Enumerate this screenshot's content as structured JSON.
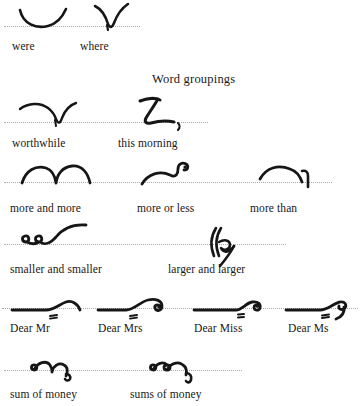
{
  "document": {
    "title": "Word groupings",
    "ink_color": "#161616",
    "rule_color": "#a9a9a9",
    "background": "#ffffff",
    "script": "shorthand"
  },
  "heading": {
    "label": "Word groupings"
  },
  "rows": [
    {
      "id": "row-1",
      "baseline_y": 26,
      "caption_y": 40,
      "items": [
        {
          "id": "were",
          "caption": "were",
          "outline_name": "shorthand-outline-were"
        },
        {
          "id": "where",
          "caption": "where",
          "outline_name": "shorthand-outline-where"
        }
      ]
    },
    {
      "id": "row-2",
      "baseline_y": 122,
      "caption_y": 137,
      "items": [
        {
          "id": "worthwhile",
          "caption": "worthwhile",
          "outline_name": "shorthand-outline-worthwhile"
        },
        {
          "id": "this-morning",
          "caption": "this morning",
          "outline_name": "shorthand-outline-this-morning"
        }
      ]
    },
    {
      "id": "row-3",
      "baseline_y": 182,
      "caption_y": 202,
      "items": [
        {
          "id": "more-and-more",
          "caption": "more and more",
          "outline_name": "shorthand-outline-more-and-more"
        },
        {
          "id": "more-or-less",
          "caption": "more or less",
          "outline_name": "shorthand-outline-more-or-less"
        },
        {
          "id": "more-than",
          "caption": "more than",
          "outline_name": "shorthand-outline-more-than"
        }
      ]
    },
    {
      "id": "row-4",
      "baseline_y": 244,
      "caption_y": 263,
      "items": [
        {
          "id": "smaller-and-smaller",
          "caption": "smaller and smaller",
          "outline_name": "shorthand-outline-smaller-and-smaller"
        },
        {
          "id": "larger-and-larger",
          "caption": "larger and larger",
          "outline_name": "shorthand-outline-larger-and-larger"
        }
      ]
    },
    {
      "id": "row-5",
      "baseline_y": 308,
      "caption_y": 322,
      "items": [
        {
          "id": "dear-mr",
          "caption": "Dear Mr",
          "outline_name": "shorthand-outline-dear-mr"
        },
        {
          "id": "dear-mrs",
          "caption": "Dear Mrs",
          "outline_name": "shorthand-outline-dear-mrs"
        },
        {
          "id": "dear-miss",
          "caption": "Dear Miss",
          "outline_name": "shorthand-outline-dear-miss"
        },
        {
          "id": "dear-ms",
          "caption": "Dear Ms",
          "outline_name": "shorthand-outline-dear-ms"
        }
      ]
    },
    {
      "id": "row-6",
      "baseline_y": 370,
      "caption_y": 388,
      "items": [
        {
          "id": "sum-of-money",
          "caption": "sum of money",
          "outline_name": "shorthand-outline-sum-of-money"
        },
        {
          "id": "sums-of-money",
          "caption": "sums of money",
          "outline_name": "shorthand-outline-sums-of-money"
        }
      ]
    }
  ]
}
